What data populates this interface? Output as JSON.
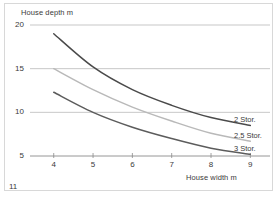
{
  "page": {
    "number": "11"
  },
  "chart_data": {
    "type": "line",
    "title": "",
    "xlabel": "House width m",
    "ylabel": "House depth m",
    "xlim": [
      3.6,
      9.5
    ],
    "ylim": [
      4.4,
      20.6
    ],
    "xticks": [
      "4",
      "5",
      "6",
      "7",
      "8",
      "9"
    ],
    "xtick_values": [
      4,
      5,
      6,
      7,
      8,
      9
    ],
    "yticks": [
      "5",
      "10",
      "15",
      "20"
    ],
    "ytick_values": [
      5,
      10,
      15,
      20
    ],
    "grid": true,
    "grid_axis": "y",
    "legend_position": "right-inline",
    "x": [
      4,
      5,
      6,
      7,
      8,
      9
    ],
    "series": [
      {
        "name": "2 Stor.",
        "label": "2 Stor.",
        "color": "#4a4a4a",
        "values": [
          19.0,
          15.2,
          12.6,
          10.8,
          9.4,
          8.5
        ]
      },
      {
        "name": "2.5 Stor.",
        "label": "2.5 Stor.",
        "color": "#b9b9b9",
        "values": [
          15.0,
          12.6,
          10.6,
          9.0,
          7.6,
          6.7
        ]
      },
      {
        "name": "3 Stor.",
        "label": "3 Stor.",
        "color": "#5c5c5c",
        "values": [
          12.3,
          10.0,
          8.3,
          7.0,
          5.9,
          5.2
        ]
      }
    ]
  },
  "colors": {
    "gridline": "#b0b0b0",
    "axis": "#8a8a8a",
    "text": "#3a3a3a",
    "frame": "#d8d8d8",
    "background": "#ffffff"
  }
}
